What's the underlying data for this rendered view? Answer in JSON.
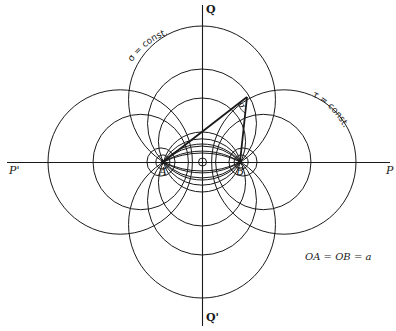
{
  "figure": {
    "axes": {
      "horizontal": {
        "left_label": "P'",
        "right_label": "P"
      },
      "vertical": {
        "top_label": "Q",
        "bottom_label": "Q'"
      }
    },
    "points": {
      "A": "A",
      "B": "B",
      "origin_marker": "O"
    },
    "curve_labels": {
      "sigma": "σ = const.",
      "tau": "τ = const."
    },
    "angle_label": "σ",
    "equation": "OA = OB = a"
  },
  "geometry": {
    "origin": [
      202,
      162
    ],
    "a": 38.5,
    "sigma_circle_tops_px": [
      64,
      93,
      136
    ],
    "tau_coth_half": [
      4.0,
      2.83,
      1.43,
      1.2
    ],
    "apex": [
      247,
      97
    ]
  },
  "colors": {
    "ink": "#1a1a1a",
    "background": "#ffffff"
  }
}
